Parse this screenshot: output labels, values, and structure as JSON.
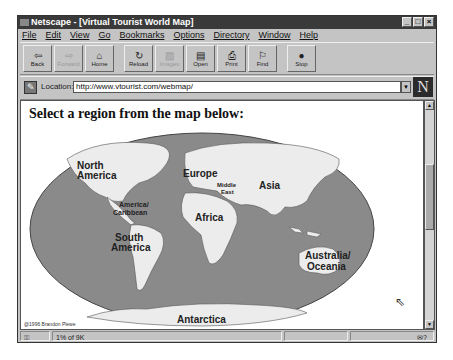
{
  "window": {
    "title": "Netscape - [Virtual Tourist World Map]",
    "controls": [
      "_",
      "□",
      "×"
    ]
  },
  "menu": [
    "File",
    "Edit",
    "View",
    "Go",
    "Bookmarks",
    "Options",
    "Directory",
    "Window",
    "Help"
  ],
  "toolbar": {
    "buttons": [
      {
        "label": "Back",
        "icon": "⇦",
        "enabled": true
      },
      {
        "label": "Forward",
        "icon": "⇨",
        "enabled": false
      },
      {
        "label": "Home",
        "icon": "⌂",
        "enabled": true
      },
      {
        "label": "Reload",
        "icon": "↻",
        "enabled": true
      },
      {
        "label": "Images",
        "icon": "▨",
        "enabled": false
      },
      {
        "label": "Open",
        "icon": "▤",
        "enabled": true
      },
      {
        "label": "Print",
        "icon": "⎙",
        "enabled": true
      },
      {
        "label": "Find",
        "icon": "⚐",
        "enabled": true
      },
      {
        "label": "Stop",
        "icon": "●",
        "enabled": true
      }
    ]
  },
  "location": {
    "label": "Location:",
    "url": "http://www.vtourist.com/webmap/",
    "logo": "N"
  },
  "page": {
    "heading": "Select a region from the map below:",
    "map": {
      "regions": [
        {
          "name": "North America",
          "lines": [
            "North",
            "America"
          ]
        },
        {
          "name": "Central America/Caribbean",
          "lines": [
            "America/",
            "Caribbean"
          ]
        },
        {
          "name": "South America",
          "lines": [
            "South",
            "America"
          ]
        },
        {
          "name": "Europe",
          "lines": [
            "Europe"
          ]
        },
        {
          "name": "Middle East",
          "lines": [
            "Middle",
            "East"
          ]
        },
        {
          "name": "Africa",
          "lines": [
            "Africa"
          ]
        },
        {
          "name": "Asia",
          "lines": [
            "Asia"
          ]
        },
        {
          "name": "Australia/Oceania",
          "lines": [
            "Australia/",
            "Oceania"
          ]
        },
        {
          "name": "Antarctica",
          "lines": [
            "Antarctica"
          ]
        }
      ],
      "credit": "@1996 Brandon Plewe"
    }
  },
  "status": {
    "progress": "1% of 9K"
  },
  "colors": {
    "ocean": "#8a8a8a",
    "land": "#ececec",
    "chrome": "#c4c4c4",
    "titlebar": "#3a3a3a"
  }
}
